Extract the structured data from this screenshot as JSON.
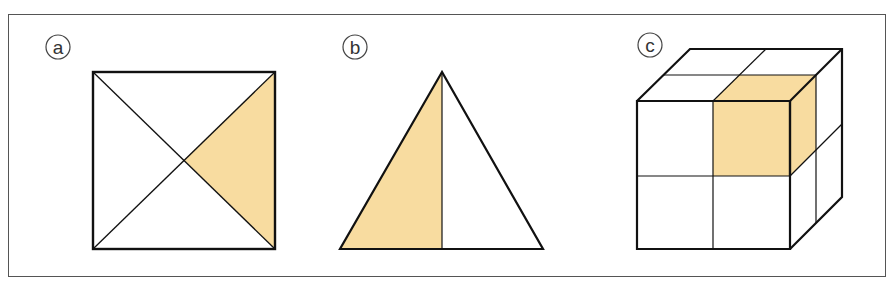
{
  "figure": {
    "panels": [
      {
        "label": "a",
        "shape": "square divided by both diagonals",
        "shaded_fraction": "1/4",
        "shaded_part": "right triangle"
      },
      {
        "label": "b",
        "shape": "triangle divided by median from apex",
        "shaded_fraction": "1/2",
        "shaded_part": "left half"
      },
      {
        "label": "c",
        "shape": "cube made of 2x2x2 smaller cubes",
        "shaded_fraction": "1/8",
        "shaded_part": "top front right small cube"
      }
    ],
    "colors": {
      "fill": "#f8dca0",
      "stroke": "#111111",
      "frame": "#555555"
    }
  }
}
